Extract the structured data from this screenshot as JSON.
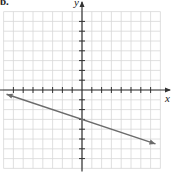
{
  "figure": {
    "part_label": "b.",
    "x_axis_label": "x",
    "y_axis_label": "y"
  },
  "colors": {
    "grid": "#d8d8d8",
    "axis": "#333333",
    "line": "#6b6b6b"
  },
  "chart_data": {
    "type": "line",
    "title": "",
    "xlabel": "x",
    "ylabel": "y",
    "xlim": [
      -8,
      8
    ],
    "ylim": [
      -8,
      8
    ],
    "grid": true,
    "tick_spacing": 1,
    "tick_labels": false,
    "legend": null,
    "series": [
      {
        "name": "y = -x/3 - 3",
        "equation": "y = -(1/3)x - 3",
        "slope": -0.3333,
        "y_intercept": -3,
        "arrows_both_ends": true,
        "x": [
          -7.7,
          7.5
        ],
        "y": [
          -0.43,
          -5.5
        ]
      }
    ]
  }
}
